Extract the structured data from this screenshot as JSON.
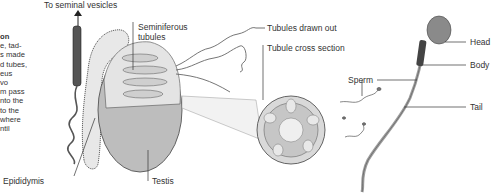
{
  "sidebar_text": {
    "heading": "on",
    "lines": [
      "e, tad-",
      "s made",
      "d tubes,",
      "eus",
      "vo",
      "m pass",
      "nto the",
      " to the",
      " where",
      "ntil"
    ]
  },
  "labels": {
    "to_seminal_vesicles": "To seminal vesicles",
    "seminiferous_tubules_line1": "Seminiferous",
    "seminiferous_tubules_line2": "tubules",
    "tubules_drawn_out": "Tubules drawn out",
    "tubule_cross_section": "Tubule cross section",
    "epididymis": "Epididymis",
    "testis": "Testis",
    "sperm": "Sperm",
    "head": "Head",
    "body": "Body",
    "tail": "Tail"
  },
  "colors": {
    "line": "#333333",
    "testis_fill": "#bdbdbd",
    "tissue_fill": "#d9d9d9",
    "sperm_head": "#8a8a8a",
    "sperm_tail": "#9e9e9e"
  }
}
